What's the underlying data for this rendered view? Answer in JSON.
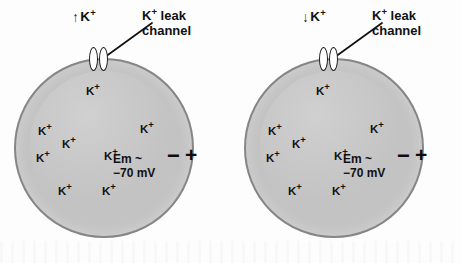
{
  "figure": {
    "background_color": "#fdfdfd",
    "cell_fill_color": "#c3c3c3",
    "cell_border_color": "#868686",
    "text_color": "#111111"
  },
  "panels": [
    {
      "id": "left",
      "flux": {
        "arrow": "↑",
        "ion": "K",
        "charge": "+"
      },
      "channel_label_line1": "K⁺ leak",
      "channel_label_line2": "channel",
      "channel_label_line1_base": "K",
      "channel_label_line1_sup": "+",
      "channel_label_line1_rest": " leak",
      "em_line1": "Em ~",
      "em_line2": "−70 mV",
      "inside_charge": "−",
      "outside_charge": "+",
      "ions": [
        {
          "label": "K",
          "sup": "+",
          "x": 86,
          "y": 85
        },
        {
          "label": "K",
          "sup": "+",
          "x": 38,
          "y": 125
        },
        {
          "label": "K",
          "sup": "+",
          "x": 62,
          "y": 138
        },
        {
          "label": "K",
          "sup": "+",
          "x": 140,
          "y": 123
        },
        {
          "label": "K",
          "sup": "+",
          "x": 36,
          "y": 152
        },
        {
          "label": "K",
          "sup": "+",
          "x": 104,
          "y": 150
        },
        {
          "label": "K",
          "sup": "+",
          "x": 58,
          "y": 185
        },
        {
          "label": "K",
          "sup": "+",
          "x": 102,
          "y": 185
        }
      ]
    },
    {
      "id": "right",
      "flux": {
        "arrow": "↓",
        "ion": "K",
        "charge": "+"
      },
      "channel_label_line1": "K⁺ leak",
      "channel_label_line2": "channel",
      "channel_label_line1_base": "K",
      "channel_label_line1_sup": "+",
      "channel_label_line1_rest": " leak",
      "em_line1": "Em ~",
      "em_line2": "−70 mV",
      "inside_charge": "−",
      "outside_charge": "+",
      "ions": [
        {
          "label": "K",
          "sup": "+",
          "x": 86,
          "y": 85
        },
        {
          "label": "K",
          "sup": "+",
          "x": 38,
          "y": 125
        },
        {
          "label": "K",
          "sup": "+",
          "x": 62,
          "y": 138
        },
        {
          "label": "K",
          "sup": "+",
          "x": 140,
          "y": 123
        },
        {
          "label": "K",
          "sup": "+",
          "x": 36,
          "y": 152
        },
        {
          "label": "K",
          "sup": "+",
          "x": 104,
          "y": 150
        },
        {
          "label": "K",
          "sup": "+",
          "x": 58,
          "y": 185
        },
        {
          "label": "K",
          "sup": "+",
          "x": 102,
          "y": 185
        }
      ]
    }
  ]
}
